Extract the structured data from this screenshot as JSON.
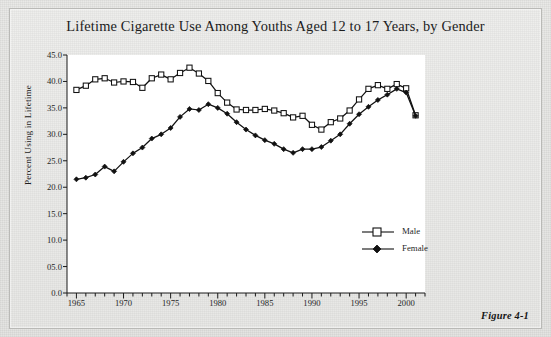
{
  "figure": {
    "caption": "Figure 4-1",
    "background_color": "#e8e8e6",
    "plot_background_color": "#ffffff"
  },
  "chart_data": {
    "type": "line",
    "title": "Lifetime Cigarette Use Among Youths Aged 12 to 17 Years, by Gender",
    "xlabel": "",
    "ylabel": "Percent Using in Lifetime",
    "xlim": [
      1964,
      2002
    ],
    "ylim": [
      0.0,
      45.0
    ],
    "ytick_labels": [
      "0.0",
      "05.0",
      "10.0",
      "15.0",
      "20.0",
      "25.0",
      "30.0",
      "35.0",
      "40.0",
      "45.0"
    ],
    "ytick_values": [
      0,
      5,
      10,
      15,
      20,
      25,
      30,
      35,
      40,
      45
    ],
    "xtick_labels": [
      "1965",
      "1970",
      "1975",
      "1980",
      "1985",
      "1990",
      "1995",
      "2000"
    ],
    "xtick_values": [
      1965,
      1970,
      1975,
      1980,
      1985,
      1990,
      1995,
      2000
    ],
    "xtick_minor_step": 1,
    "grid": false,
    "legend_position": "center-right",
    "x": [
      1965,
      1966,
      1967,
      1968,
      1969,
      1970,
      1971,
      1972,
      1973,
      1974,
      1975,
      1976,
      1977,
      1978,
      1979,
      1980,
      1981,
      1982,
      1983,
      1984,
      1985,
      1986,
      1987,
      1988,
      1989,
      1990,
      1991,
      1992,
      1993,
      1994,
      1995,
      1996,
      1997,
      1998,
      1999,
      2000,
      2001
    ],
    "series": [
      {
        "name": "Male",
        "marker": "open-square",
        "color": "#111111",
        "values": [
          38.4,
          39.2,
          40.4,
          40.6,
          39.8,
          40.0,
          39.9,
          38.8,
          40.6,
          41.3,
          40.4,
          41.6,
          42.6,
          41.5,
          40.1,
          37.8,
          36.0,
          34.7,
          34.6,
          34.6,
          34.8,
          34.5,
          34.0,
          33.2,
          33.5,
          31.8,
          30.9,
          32.3,
          33.0,
          34.5,
          36.6,
          38.6,
          39.3,
          38.6,
          39.5,
          38.7,
          33.6
        ]
      },
      {
        "name": "Female",
        "marker": "filled-diamond",
        "color": "#111111",
        "values": [
          21.5,
          21.8,
          22.4,
          23.9,
          23.0,
          24.8,
          26.4,
          27.5,
          29.2,
          30.0,
          31.2,
          33.3,
          34.8,
          34.6,
          35.7,
          35.0,
          33.9,
          32.3,
          30.9,
          29.8,
          28.9,
          28.2,
          27.2,
          26.5,
          27.2,
          27.2,
          27.6,
          28.8,
          30.0,
          32.0,
          33.8,
          35.2,
          36.5,
          37.5,
          38.6,
          37.9,
          33.5
        ]
      }
    ]
  }
}
